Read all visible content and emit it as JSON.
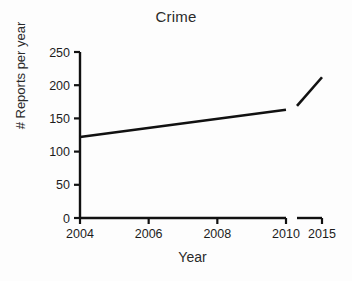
{
  "chart_data": {
    "type": "line",
    "title": "Crime",
    "xlabel": "Year",
    "ylabel": "# Reports per year",
    "grid": false,
    "legend": "none",
    "xlim": [
      2004,
      2010
    ],
    "ylim": [
      0,
      250
    ],
    "y_ticks": [
      0,
      50,
      100,
      150,
      200,
      250
    ],
    "y_tick_labels": [
      "0",
      "50",
      "100",
      "150",
      "200",
      "250"
    ],
    "x_ticks": [
      2004,
      2006,
      2008,
      2010,
      2015
    ],
    "x_tick_labels": [
      "2004",
      "2006",
      "2008",
      "2010",
      "2015"
    ],
    "axis_break": {
      "present": true,
      "after": 2010,
      "resumes_at": 2015,
      "note": "x-axis is broken between 2010 and 2015"
    },
    "series": [
      {
        "name": "Reports per year (2004-2010)",
        "x": [
          2004,
          2010
        ],
        "values": [
          122,
          163
        ],
        "color": "#111111"
      },
      {
        "name": "Reports per year (2011-2015)",
        "x": [
          2011,
          2015
        ],
        "values": [
          169,
          212
        ],
        "color": "#111111"
      }
    ]
  },
  "axis": {
    "title_text": "Crime",
    "x_label_text": "Year",
    "y_label_text": "# Reports per year"
  }
}
